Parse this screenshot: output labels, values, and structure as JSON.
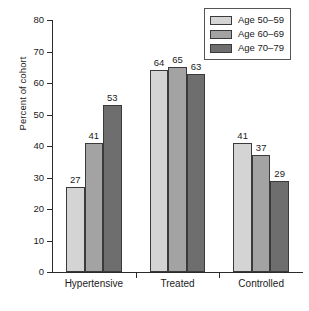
{
  "chart_data": {
    "type": "bar",
    "title": "",
    "xlabel": "",
    "ylabel": "Percent of cohort",
    "categories": [
      "Hypertensive",
      "Treated",
      "Controlled"
    ],
    "series": [
      {
        "name": "Age 50–59",
        "values": [
          27,
          64,
          41
        ],
        "color": "#d4d4d4"
      },
      {
        "name": "Age 60–69",
        "values": [
          41,
          65,
          37
        ],
        "color": "#a3a3a3"
      },
      {
        "name": "Age 70–79",
        "values": [
          53,
          63,
          29
        ],
        "color": "#6e6e6e"
      }
    ],
    "ylim": [
      0,
      80
    ],
    "yticks": [
      0,
      10,
      20,
      30,
      40,
      50,
      60,
      70,
      80
    ],
    "ytick_labels": [
      "0",
      "10",
      "20",
      "30",
      "40",
      "50",
      "60",
      "70",
      "80"
    ],
    "grid": false,
    "legend_position": "top-right",
    "value_labels": true,
    "bar_outline_color": "#3a3a3a",
    "axis_color": "#2b2b2b"
  }
}
